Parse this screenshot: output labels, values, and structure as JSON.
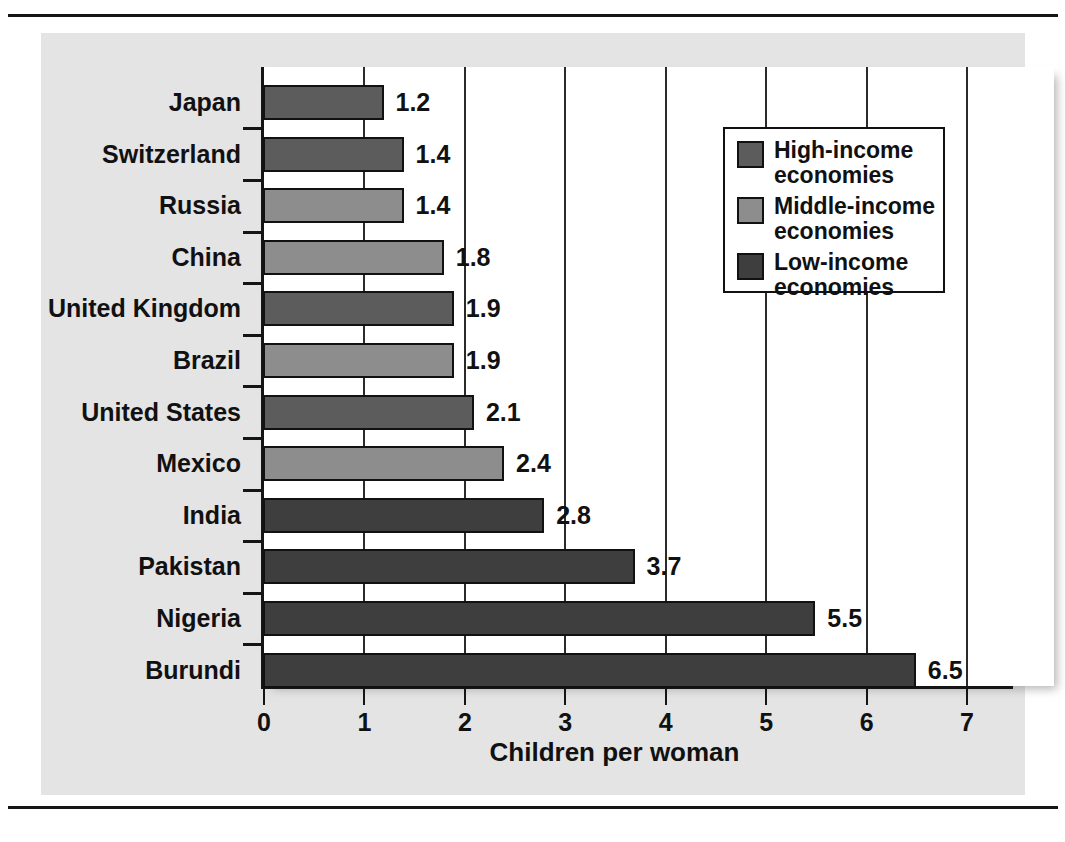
{
  "chart_data": {
    "type": "bar",
    "orientation": "horizontal",
    "title": "",
    "xlabel": "Children per woman",
    "ylabel": "",
    "xlim": [
      0,
      7
    ],
    "xticks": [
      "0",
      "1",
      "2",
      "3",
      "4",
      "5",
      "6",
      "7"
    ],
    "grid": true,
    "legend_position": "upper right",
    "categories": [
      "Japan",
      "Switzerland",
      "Russia",
      "China",
      "United Kingdom",
      "Brazil",
      "United States",
      "Mexico",
      "India",
      "Pakistan",
      "Nigeria",
      "Burundi"
    ],
    "values": [
      1.2,
      1.4,
      1.4,
      1.8,
      1.9,
      1.9,
      2.1,
      2.4,
      2.8,
      3.7,
      5.5,
      6.5
    ],
    "value_labels": [
      "1.2",
      "1.4",
      "1.4",
      "1.8",
      "1.9",
      "1.9",
      "2.1",
      "2.4",
      "2.8",
      "3.7",
      "5.5",
      "6.5"
    ],
    "groups": [
      "high",
      "high",
      "middle",
      "middle",
      "high",
      "middle",
      "high",
      "middle",
      "low",
      "low",
      "low",
      "low"
    ],
    "series": [
      {
        "name": "High-income economies",
        "key": "high",
        "color": "#5c5c5c",
        "points": [
          {
            "category": "Japan",
            "value": 1.2
          },
          {
            "category": "Switzerland",
            "value": 1.4
          },
          {
            "category": "United Kingdom",
            "value": 1.9
          },
          {
            "category": "United States",
            "value": 2.1
          }
        ]
      },
      {
        "name": "Middle-income economies",
        "key": "middle",
        "color": "#8d8d8d",
        "points": [
          {
            "category": "Russia",
            "value": 1.4
          },
          {
            "category": "China",
            "value": 1.8
          },
          {
            "category": "Brazil",
            "value": 1.9
          },
          {
            "category": "Mexico",
            "value": 2.4
          }
        ]
      },
      {
        "name": "Low-income economies",
        "key": "low",
        "color": "#3e3e3e",
        "points": [
          {
            "category": "India",
            "value": 2.8
          },
          {
            "category": "Pakistan",
            "value": 3.7
          },
          {
            "category": "Nigeria",
            "value": 5.5
          },
          {
            "category": "Burundi",
            "value": 6.5
          }
        ]
      }
    ]
  },
  "legend": {
    "items": [
      {
        "label_line1": "High-income",
        "label_line2": "economies",
        "key": "high"
      },
      {
        "label_line1": "Middle-income",
        "label_line2": "economies",
        "key": "middle"
      },
      {
        "label_line1": "Low-income",
        "label_line2": "economies",
        "key": "low"
      }
    ]
  },
  "axis": {
    "x_title": "Children per woman"
  }
}
